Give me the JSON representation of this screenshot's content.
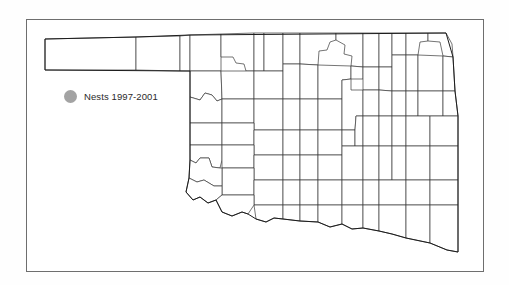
{
  "figure": {
    "title": "",
    "frame_color": "#6e6e6e",
    "background_color": "#ffffff"
  },
  "legend": {
    "label": "Nests 1997-2001",
    "symbol": "filled-circle",
    "symbol_color": "#a3a3a3",
    "entries": [
      {
        "label": "Nests 1997-2001",
        "color": "#a3a3a3",
        "symbol": "filled-circle"
      }
    ]
  },
  "map": {
    "state": "Oklahoma",
    "county_line_color": "#3a3a3a",
    "state_line_color": "#1c1c1c",
    "fill_color": "#ffffff",
    "data_points": [],
    "panhandle_counties": 3,
    "notes": "No nest location markers plotted inside the state boundary."
  }
}
